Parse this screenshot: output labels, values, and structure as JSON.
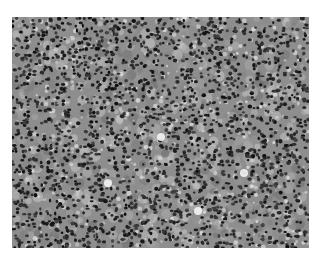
{
  "image": {
    "subject": "grayscale histology micrograph of densely packed round cells with dark nuclei",
    "background_color": "#ffffff",
    "tissue_base_color": "#8e8e8e",
    "nucleus_color": "#1e1e1e",
    "highlight_color": "#f4f4f4"
  }
}
